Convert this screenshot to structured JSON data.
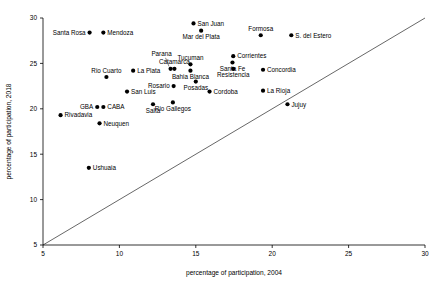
{
  "chart_data": {
    "type": "scatter",
    "title": "",
    "xlabel": "percentage of participation, 2004",
    "ylabel": "percentage of participation, 2018",
    "xlim": [
      5,
      30
    ],
    "ylim": [
      5,
      30
    ],
    "xticks": [
      5,
      10,
      15,
      20,
      25,
      30
    ],
    "yticks": [
      5,
      10,
      15,
      20,
      25,
      30
    ],
    "grid": false,
    "legend": "none",
    "annotations": [
      {
        "name": "identity-line",
        "type": "line",
        "from": [
          5,
          5
        ],
        "to": [
          30,
          30
        ],
        "note": "y = x reference line"
      },
      {
        "name": "parana-leader",
        "type": "leader-line",
        "note": "connects Parana label to its marker"
      }
    ],
    "points": [
      {
        "label": "Santa Rosa",
        "x": 8.05,
        "y": 28.4,
        "pos": "left"
      },
      {
        "label": "Mendoza",
        "x": 8.95,
        "y": 28.4,
        "pos": "right"
      },
      {
        "label": "San Juan",
        "x": 14.85,
        "y": 29.4,
        "pos": "right"
      },
      {
        "label": "Mar del Plata",
        "x": 15.35,
        "y": 28.6,
        "pos": "below"
      },
      {
        "label": "Formosa",
        "x": 19.25,
        "y": 28.1,
        "pos": "above"
      },
      {
        "label": "S. del Estero",
        "x": 21.25,
        "y": 28.1,
        "pos": "right"
      },
      {
        "label": "Parana",
        "x": 13.35,
        "y": 24.4,
        "pos": "leader"
      },
      {
        "label": "Catamarca",
        "x": 13.6,
        "y": 24.4,
        "pos": "above"
      },
      {
        "label": "Tucuman",
        "x": 14.65,
        "y": 24.9,
        "pos": "above"
      },
      {
        "label": "Santa Fe",
        "x": 17.4,
        "y": 25.1,
        "pos": "below"
      },
      {
        "label": "Corrientes",
        "x": 17.45,
        "y": 25.8,
        "pos": "right"
      },
      {
        "label": "Rio Cuarto",
        "x": 9.15,
        "y": 23.5,
        "pos": "above"
      },
      {
        "label": "La Plata",
        "x": 10.9,
        "y": 24.2,
        "pos": "right"
      },
      {
        "label": "Concordia",
        "x": 19.4,
        "y": 24.3,
        "pos": "right"
      },
      {
        "label": "Bahia Blanca",
        "x": 14.65,
        "y": 24.2,
        "pos": "below"
      },
      {
        "label": "Resistencia",
        "x": 17.45,
        "y": 24.4,
        "pos": "below"
      },
      {
        "label": "Posadas",
        "x": 15.0,
        "y": 23.0,
        "pos": "below"
      },
      {
        "label": "Rosario",
        "x": 13.55,
        "y": 22.5,
        "pos": "left"
      },
      {
        "label": "San Luis",
        "x": 10.5,
        "y": 21.9,
        "pos": "right"
      },
      {
        "label": "Cordoba",
        "x": 15.9,
        "y": 21.9,
        "pos": "right"
      },
      {
        "label": "La Rioja",
        "x": 19.4,
        "y": 22.0,
        "pos": "right"
      },
      {
        "label": "GBA",
        "x": 8.55,
        "y": 20.2,
        "pos": "left"
      },
      {
        "label": "CABA",
        "x": 8.95,
        "y": 20.2,
        "pos": "right"
      },
      {
        "label": "Salta",
        "x": 12.2,
        "y": 20.5,
        "pos": "below"
      },
      {
        "label": "Rio Gallegos",
        "x": 13.5,
        "y": 20.7,
        "pos": "below"
      },
      {
        "label": "Jujuy",
        "x": 21.0,
        "y": 20.5,
        "pos": "right"
      },
      {
        "label": "Rivadavia",
        "x": 6.15,
        "y": 19.3,
        "pos": "right"
      },
      {
        "label": "Neuquen",
        "x": 8.7,
        "y": 18.4,
        "pos": "right"
      },
      {
        "label": "Ushuaia",
        "x": 8.0,
        "y": 13.5,
        "pos": "right"
      }
    ]
  }
}
